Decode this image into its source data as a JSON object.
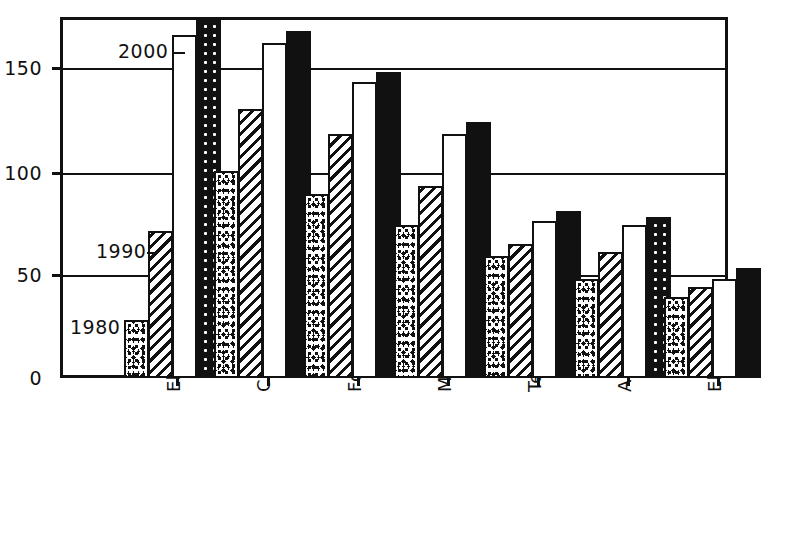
{
  "chart_data": {
    "type": "bar",
    "title": "",
    "xlabel": "",
    "ylabel": "",
    "ylim": [
      0,
      175
    ],
    "yticks": [
      0,
      50,
      100,
      150
    ],
    "ytick_labels": [
      "0",
      "50",
      "100",
      "150"
    ],
    "grid": true,
    "legend_position": "in-plot-annotations",
    "categories": [
      "Electronics",
      "Chemistry and oil",
      "Food, drinks",
      "Machines, optics",
      "Textile, leather",
      "Automobile",
      "Electric"
    ],
    "series": [
      {
        "name": "1980",
        "pattern": "dotted",
        "values": [
          28,
          100,
          89,
          74,
          59,
          48,
          39
        ]
      },
      {
        "name": "1990",
        "pattern": "hatched",
        "values": [
          71,
          130,
          118,
          93,
          65,
          61,
          44
        ]
      },
      {
        "name": "2000",
        "pattern": "white",
        "values": [
          166,
          162,
          143,
          118,
          76,
          74,
          48
        ]
      },
      {
        "name": "",
        "pattern": "black",
        "values": [
          174,
          168,
          148,
          124,
          81,
          78,
          53
        ]
      }
    ],
    "annotations": [
      {
        "label": "2000",
        "value": 166
      },
      {
        "label": "1990",
        "value": 71
      },
      {
        "label": "1980",
        "value": 28
      }
    ]
  },
  "axis": {
    "y_tick_0": "0",
    "y_tick_50": "50",
    "y_tick_100": "100",
    "y_tick_150": "150"
  },
  "annotations": {
    "a2000": "2000",
    "a1990": "1990",
    "a1980": "1980"
  },
  "categories": {
    "c0": "Electronics",
    "c1": "Chemistry and oil",
    "c2": "Food, drinks",
    "c3": "Machines, optics",
    "c4": "Textile, leather",
    "c5": "Automobile",
    "c6": "Electric"
  },
  "colors": {
    "ink": "#111111",
    "paper": "#ffffff"
  }
}
